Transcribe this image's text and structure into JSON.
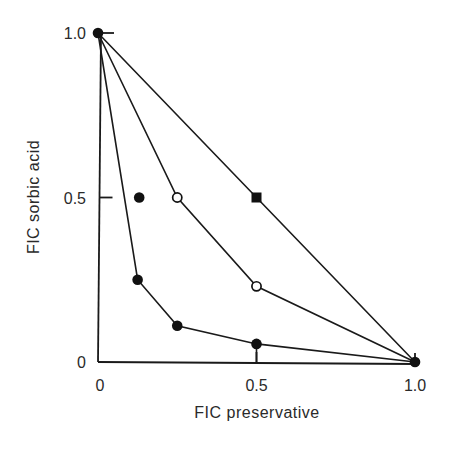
{
  "chart_data": {
    "type": "line",
    "title": "",
    "xlabel": "FIC preservative",
    "ylabel": "FIC sorbic acid",
    "xlim": [
      0,
      1.0
    ],
    "ylim": [
      0,
      1.0
    ],
    "xticks": [
      {
        "value": 0,
        "label": "0"
      },
      {
        "value": 0.5,
        "label": "0.5"
      },
      {
        "value": 1.0,
        "label": "1.0"
      }
    ],
    "yticks": [
      {
        "value": 0,
        "label": "0"
      },
      {
        "value": 0.5,
        "label": "0.5"
      },
      {
        "value": 1.0,
        "label": "1.0"
      }
    ],
    "grid": false,
    "legend": null,
    "series": [
      {
        "name": "additive-line",
        "marker": "filled-square",
        "points": [
          [
            0,
            1.0
          ],
          [
            0.5,
            0.5
          ],
          [
            1.0,
            0
          ]
        ]
      },
      {
        "name": "open-circle-series",
        "marker": "open-circle",
        "points": [
          [
            0,
            1.0
          ],
          [
            0.25,
            0.5
          ],
          [
            0.5,
            0.23
          ],
          [
            1.0,
            0
          ]
        ]
      },
      {
        "name": "filled-circle-series",
        "marker": "filled-circle",
        "points": [
          [
            0,
            1.0
          ],
          [
            0.125,
            0.25
          ],
          [
            0.25,
            0.11
          ],
          [
            0.5,
            0.055
          ],
          [
            1.0,
            0
          ]
        ]
      }
    ],
    "isolated_points": [
      {
        "name": "isolated-filled-point",
        "marker": "filled-circle",
        "x": 0.13,
        "y": 0.5
      }
    ],
    "endpoints": [
      {
        "name": "endpoint-y",
        "marker": "filled-circle",
        "x": 0,
        "y": 1.0
      },
      {
        "name": "endpoint-x",
        "marker": "filled-circle",
        "x": 1.0,
        "y": 0
      }
    ],
    "drop_lines": [
      {
        "x": 0.5,
        "y": 0.055
      }
    ]
  }
}
